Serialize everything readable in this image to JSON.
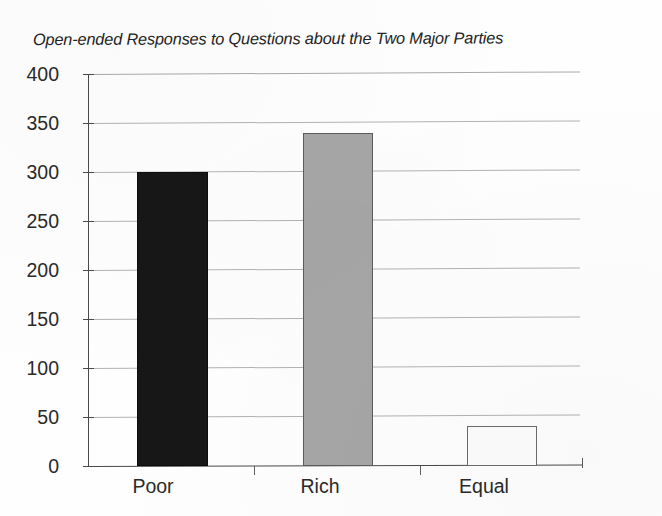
{
  "chart_data": {
    "type": "bar",
    "title": "Open-ended Responses to Questions about the Two Major Parties",
    "xlabel": "",
    "ylabel": "",
    "categories": [
      "Poor",
      "Rich",
      "Equal"
    ],
    "values": [
      300,
      340,
      41
    ],
    "ylim": [
      0,
      400
    ],
    "yticks": [
      0,
      50,
      100,
      150,
      200,
      250,
      300,
      350,
      400
    ],
    "ytick_labels": [
      "0",
      "50",
      "100",
      "150",
      "200",
      "250",
      "300",
      "350",
      "400"
    ],
    "grid": true,
    "grid_axis": "y",
    "legend": false,
    "bar_colors": [
      "#171717",
      "#a6a6a6",
      "#fdfdfd"
    ],
    "bar_edge_colors": [
      "#0d0d0d",
      "#5c5c5c",
      "#6b6b6b"
    ],
    "series": [
      {
        "name": "Responses",
        "values": [
          300,
          340,
          41
        ]
      }
    ]
  },
  "axis": {
    "y_ticks": [
      {
        "value": 400,
        "label": "400"
      },
      {
        "value": 350,
        "label": "350"
      },
      {
        "value": 300,
        "label": "300"
      },
      {
        "value": 250,
        "label": "250"
      },
      {
        "value": 200,
        "label": "200"
      },
      {
        "value": 150,
        "label": "150"
      },
      {
        "value": 100,
        "label": "100"
      },
      {
        "value": 50,
        "label": "50"
      },
      {
        "value": 0,
        "label": "0"
      }
    ],
    "x_categories": [
      {
        "label": "Poor"
      },
      {
        "label": "Rich"
      },
      {
        "label": "Equal"
      }
    ]
  }
}
